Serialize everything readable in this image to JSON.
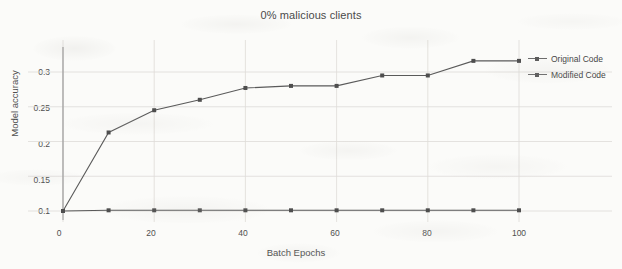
{
  "chart_data": {
    "type": "line",
    "title": "0% malicious clients",
    "xlabel": "Batch Epochs",
    "ylabel": "Model accuracy",
    "x": [
      0,
      10,
      20,
      30,
      40,
      50,
      60,
      70,
      80,
      90,
      100
    ],
    "series": [
      {
        "name": "Original Code",
        "values": [
          0.1,
          0.101,
          0.101,
          0.101,
          0.101,
          0.101,
          0.101,
          0.101,
          0.101,
          0.101,
          0.101
        ],
        "color": "#5a5a5a",
        "marker": "square"
      },
      {
        "name": "Modified Code",
        "values": [
          0.1,
          0.213,
          0.245,
          0.26,
          0.277,
          0.28,
          0.28,
          0.295,
          0.295,
          0.316,
          0.316
        ],
        "color": "#5a5a5a",
        "marker": "square"
      }
    ],
    "xlim": [
      -2,
      104
    ],
    "ylim": [
      0.093,
      0.333
    ],
    "xticks": [
      0,
      20,
      40,
      60,
      80,
      100
    ],
    "xtick_labels": [
      "0",
      "20",
      "40",
      "60",
      "80",
      "100"
    ],
    "yticks": [
      0.1,
      0.15,
      0.2,
      0.25,
      0.3
    ],
    "ytick_labels": [
      "0.1",
      "0.15",
      "0.2",
      "0.25",
      "0.3"
    ],
    "grid": "both-light",
    "legend_position": "right-top"
  },
  "legend": {
    "items": [
      {
        "label": "Original Code"
      },
      {
        "label": "Modified Code"
      }
    ]
  },
  "axes": {
    "y_tick_labels": [
      "0.3",
      "0.25",
      "0.2",
      "0.15",
      "0.1"
    ],
    "x_tick_labels": [
      "0",
      "20",
      "40",
      "60",
      "80",
      "100"
    ]
  },
  "colors": {
    "background": "#fbfbf9",
    "line": "#5a5a5a",
    "marker": "#4e4e4e",
    "grid": "#dedcd8",
    "axis": "#9a9a9a",
    "text": "#4a4a4a"
  }
}
